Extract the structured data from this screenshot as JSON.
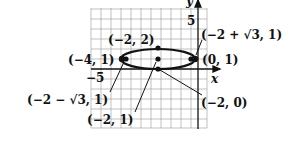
{
  "diagram": {
    "type": "ellipse-graph",
    "grid": {
      "x_min": -7,
      "x_max": 1,
      "y_min": -4,
      "y_max": 7,
      "unit_px": 10
    },
    "axes": {
      "x_label": "x",
      "y_label": "y",
      "x_tick_label": "−5",
      "y_tick_label": "5"
    },
    "ellipse": {
      "center": [
        -2,
        1
      ],
      "a": 2,
      "b": 1
    },
    "points": [
      {
        "label": "(−4, 1)",
        "name": "vertex-left"
      },
      {
        "label": "(0, 1)",
        "name": "vertex-right"
      },
      {
        "label": "(−2, 2)",
        "name": "covertex-top"
      },
      {
        "label": "(−2, 0)",
        "name": "covertex-bottom"
      },
      {
        "label": "(−2, 1)",
        "name": "center"
      },
      {
        "label": "(−2 − √3, 1)",
        "name": "focus-left"
      },
      {
        "label": "(−2 + √3, 1)",
        "name": "focus-right"
      }
    ]
  }
}
